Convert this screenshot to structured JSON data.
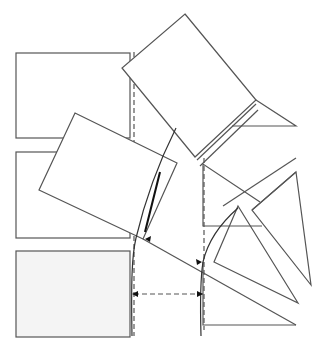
{
  "diagram": {
    "width": 326,
    "height": 351,
    "colors": {
      "stroke": "#555555",
      "dark_stroke": "#111111",
      "fill_light": "#f4f4f4",
      "background": "#ffffff"
    },
    "rectangles": [
      {
        "name": "rect-top",
        "x": 16,
        "y": 53,
        "w": 114,
        "h": 85,
        "fill": "#ffffff"
      },
      {
        "name": "rect-middle",
        "x": 16,
        "y": 152,
        "w": 114,
        "h": 86,
        "fill": "#ffffff"
      },
      {
        "name": "rect-bottom",
        "x": 16,
        "y": 251,
        "w": 114,
        "h": 86,
        "fill": "#f4f4f4"
      }
    ],
    "rotated_rects": [
      {
        "name": "rotated-rect-top",
        "points": "185,14 256,100 195,157 122,68"
      },
      {
        "name": "rotated-rect-middle",
        "points": "75,113 177,163 143,239 39,190"
      }
    ],
    "triangles": [
      {
        "name": "triangle-upper-right",
        "points": "256,100 296,126 232,126"
      },
      {
        "name": "triangle-right-box",
        "points": "203,164 203,226 260,226"
      },
      {
        "name": "triangle-tall",
        "points": "296,172 311,285 252,210"
      },
      {
        "name": "triangle-middle",
        "points": "238,206 214,262 298,303"
      },
      {
        "name": "triangle-bottom",
        "points": "203,262 203,325 296,325"
      }
    ],
    "dashed_lines": [
      {
        "name": "dashed-vertical-left",
        "x1": 134,
        "y1": 52,
        "x2": 134,
        "y2": 336
      },
      {
        "name": "dashed-vertical-right",
        "x1": 204,
        "y1": 158,
        "x2": 204,
        "y2": 330
      },
      {
        "name": "dashed-horizontal",
        "x1": 134,
        "y1": 294,
        "x2": 204,
        "y2": 294
      }
    ]
  }
}
